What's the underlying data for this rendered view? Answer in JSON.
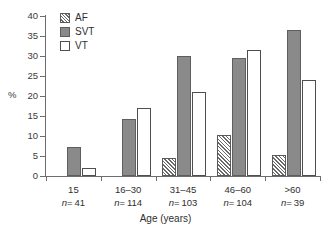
{
  "chart_data": {
    "type": "bar",
    "title": "",
    "xlabel": "Age (years)",
    "ylabel": "%",
    "ylim": [
      0,
      40
    ],
    "yticks": [
      0,
      5,
      10,
      15,
      20,
      25,
      30,
      35,
      40
    ],
    "ytick_labels": [
      "0",
      "5",
      "10",
      "15",
      "20",
      "25",
      "30",
      "35",
      "40"
    ],
    "grid": false,
    "legend_position": "top-left",
    "categories": [
      "15",
      "16–30",
      "31–45",
      "46–60",
      ">60"
    ],
    "category_counts": [
      "n = 41",
      "n = 114",
      "n = 103",
      "n = 104",
      "n = 39"
    ],
    "category_n_prefix": "n",
    "category_n_values": [
      "= 41",
      "= 114",
      "= 103",
      "= 104",
      "= 39"
    ],
    "series": [
      {
        "name": "AF",
        "fill": "hatched",
        "color": "#ffffff",
        "hatch_color": "#6a6a6a",
        "values": [
          null,
          null,
          4.4,
          10.2,
          5.3
        ]
      },
      {
        "name": "SVT",
        "fill": "solid",
        "color": "#8a8a8a",
        "values": [
          7.3,
          14.2,
          30.0,
          29.5,
          36.5
        ]
      },
      {
        "name": "VT",
        "fill": "open",
        "color": "#ffffff",
        "values": [
          2.0,
          17.0,
          21.0,
          31.5,
          24.0
        ]
      }
    ]
  },
  "axis": {
    "y_title": "%",
    "x_title": "Age (years)"
  },
  "legend": {
    "items": [
      {
        "label": "AF",
        "style": "af"
      },
      {
        "label": "SVT",
        "style": "svt"
      },
      {
        "label": "VT",
        "style": "vt"
      }
    ]
  }
}
